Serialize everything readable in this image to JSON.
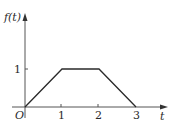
{
  "chart_data": {
    "type": "line",
    "title": "",
    "xlabel": "t",
    "ylabel": "f(t)",
    "origin_label": "O",
    "x": [
      0,
      1,
      2,
      3
    ],
    "series": [
      {
        "name": "f(t)",
        "values": [
          0,
          1,
          1,
          0
        ]
      }
    ],
    "x_ticks": [
      "1",
      "2",
      "3"
    ],
    "y_ticks": [
      "1"
    ],
    "xlim": [
      0,
      3.5
    ],
    "ylim": [
      0,
      1.6
    ],
    "grid": false,
    "legend": "none",
    "line_color": "#2a2a2a"
  }
}
